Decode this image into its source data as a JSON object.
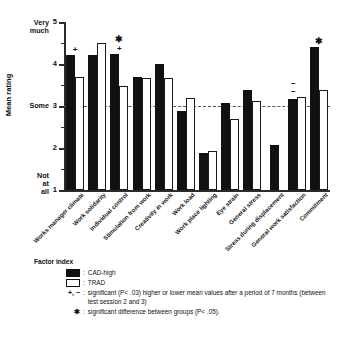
{
  "chart_data": {
    "type": "bar",
    "title": "",
    "xlabel": "",
    "ylabel": "Mean rating",
    "ylim": [
      1,
      5
    ],
    "yticks": [
      1,
      2,
      3,
      4,
      5
    ],
    "ytick_labels": [
      "1",
      "2",
      "3",
      "4",
      "5"
    ],
    "axis_anchors": [
      {
        "value": 5,
        "text": "Very\nmuch"
      },
      {
        "value": 3,
        "text": "Some"
      },
      {
        "value": 1,
        "text": "Not at\nall"
      }
    ],
    "reference_line": 3,
    "grid": false,
    "legend_position": "below",
    "categories": [
      "Works manager climate",
      "Work solidarity",
      "Individual control",
      "Stimulation from work",
      "Creativity in work",
      "Work load",
      "Work place lighting",
      "Eye strain",
      "General stress",
      "Stress during displacement",
      "General work satisfaction",
      "Commitment"
    ],
    "series": [
      {
        "name": "CAD-high",
        "color": "#111111",
        "values": [
          4.22,
          4.22,
          4.25,
          3.7,
          4.0,
          2.87,
          1.88,
          3.08,
          3.37,
          2.06,
          3.17,
          4.4
        ]
      },
      {
        "name": "TRAD",
        "color": "#ffffff",
        "values": [
          3.7,
          4.5,
          3.48,
          3.67,
          3.67,
          3.18,
          1.93,
          2.7,
          3.12,
          null,
          3.22,
          3.37
        ]
      }
    ],
    "annotations": [
      {
        "category": "Works manager climate",
        "marks": [
          "+"
        ]
      },
      {
        "category": "Individual control",
        "marks": [
          "✱",
          "+"
        ]
      },
      {
        "category": "General work satisfaction",
        "marks": [
          "− −"
        ]
      },
      {
        "category": "Commitment",
        "marks": [
          "✱"
        ]
      }
    ]
  },
  "legend": {
    "title": "Factor index",
    "entries": [
      {
        "symbol": "cad-swatch",
        "label": "CAD-high"
      },
      {
        "symbol": "trad-swatch",
        "label": "TRAD"
      }
    ],
    "notes": [
      {
        "symbol": "+, −",
        "text": "significant (P< .03) higher or lower mean values after a period of 7 months (between test session 2 and 3)"
      },
      {
        "symbol": "✱",
        "text": "significant difference between groups (P< .05)."
      }
    ]
  }
}
